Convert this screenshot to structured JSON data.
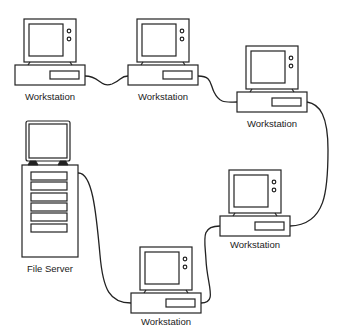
{
  "diagram": {
    "type": "ring network topology",
    "nodes": [
      {
        "id": "ws1",
        "label": "Workstation",
        "kind": "workstation"
      },
      {
        "id": "ws2",
        "label": "Workstation",
        "kind": "workstation"
      },
      {
        "id": "ws3",
        "label": "Workstation",
        "kind": "workstation"
      },
      {
        "id": "ws4",
        "label": "Workstation",
        "kind": "workstation"
      },
      {
        "id": "ws5",
        "label": "Workstation",
        "kind": "workstation"
      },
      {
        "id": "fs",
        "label": "File Server",
        "kind": "file-server"
      }
    ],
    "connections": [
      [
        "ws1",
        "ws2"
      ],
      [
        "ws2",
        "ws3"
      ],
      [
        "ws3",
        "ws4"
      ],
      [
        "ws4",
        "ws5"
      ],
      [
        "ws5",
        "fs"
      ]
    ],
    "colors": {
      "stroke": "#222222",
      "background": "#ffffff"
    }
  }
}
